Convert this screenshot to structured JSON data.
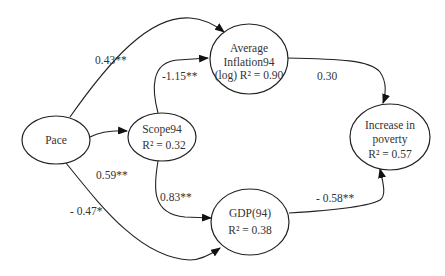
{
  "diagram": {
    "type": "path-model",
    "nodes": [
      {
        "id": "pace",
        "lines": [
          "Pace"
        ]
      },
      {
        "id": "scope94",
        "lines": [
          "Scope94",
          "R² = 0.32"
        ]
      },
      {
        "id": "inflation",
        "lines": [
          "Average",
          "Inflation94",
          "(log) R² = 0.90"
        ]
      },
      {
        "id": "gdp",
        "lines": [
          "GDP(94)",
          "R² = 0.38"
        ]
      },
      {
        "id": "poverty",
        "lines": [
          "Increase in",
          "poverty",
          "R² = 0.57"
        ]
      }
    ],
    "edges": [
      {
        "from": "pace",
        "to": "inflation",
        "label": "0.43**"
      },
      {
        "from": "pace",
        "to": "scope94",
        "label": "0.59**"
      },
      {
        "from": "pace",
        "to": "gdp",
        "label": "- 0.47*"
      },
      {
        "from": "scope94",
        "to": "inflation",
        "label": "-1.15**"
      },
      {
        "from": "scope94",
        "to": "gdp",
        "label": "0.83**"
      },
      {
        "from": "inflation",
        "to": "poverty",
        "label": "0.30"
      },
      {
        "from": "gdp",
        "to": "poverty",
        "label": "- 0.58**"
      }
    ]
  }
}
